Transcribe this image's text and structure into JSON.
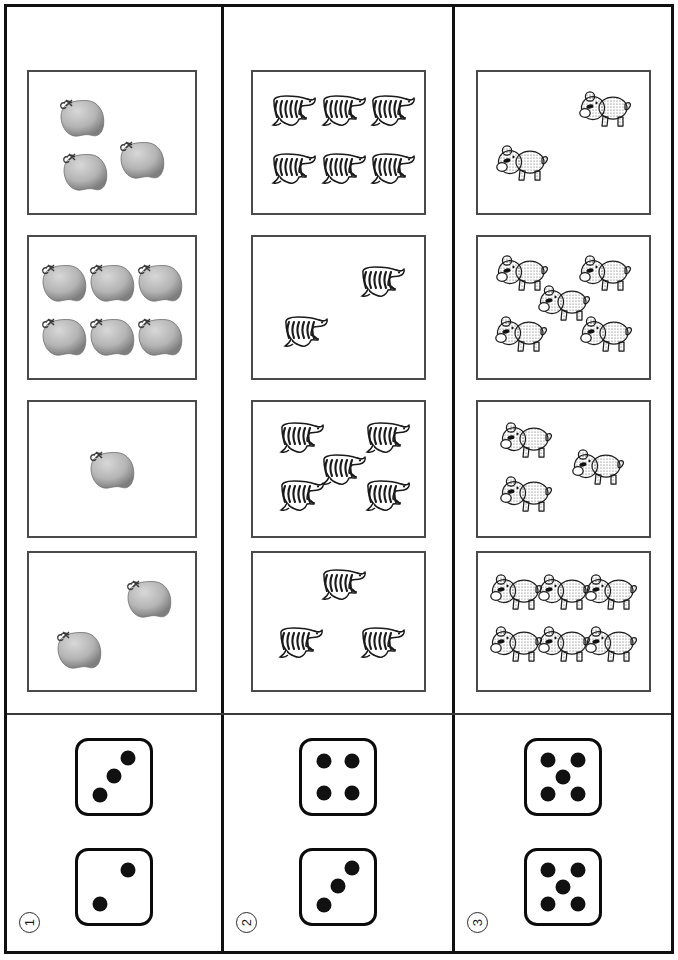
{
  "worksheet": {
    "layout": "three-column counting worksheet",
    "rows": 4,
    "columns": 3
  },
  "colors": {
    "ink": "#111111",
    "box_border": "#4a4a4a",
    "apple_light": "#d8d8d8",
    "apple_dark": "#7e7e7e",
    "zebra_stripe": "#1a1a1a",
    "bear_fill": "#f2f2f2",
    "bear_speckle": "#5a5a5a"
  },
  "columns": [
    {
      "id": "column-1",
      "number_label": "1",
      "icon_name": "apple-icon",
      "boxes": [
        {
          "row": 1,
          "count": 3,
          "arrangement": "scatter-3"
        },
        {
          "row": 2,
          "count": 6,
          "arrangement": "grid-3x2"
        },
        {
          "row": 3,
          "count": 1,
          "arrangement": "center-1"
        },
        {
          "row": 4,
          "count": 2,
          "arrangement": "diagonal-2"
        }
      ],
      "dice": [
        {
          "position": "top",
          "value": 3,
          "face_name": "die-face-3"
        },
        {
          "position": "bottom",
          "value": 2,
          "face_name": "die-face-2"
        }
      ]
    },
    {
      "id": "column-2",
      "number_label": "2",
      "icon_name": "zebra-icon",
      "boxes": [
        {
          "row": 1,
          "count": 6,
          "arrangement": "grid-3x2"
        },
        {
          "row": 2,
          "count": 2,
          "arrangement": "diagonal-2"
        },
        {
          "row": 3,
          "count": 5,
          "arrangement": "quincunx-5"
        },
        {
          "row": 4,
          "count": 3,
          "arrangement": "triangle-3"
        }
      ],
      "dice": [
        {
          "position": "top",
          "value": 4,
          "face_name": "die-face-4"
        },
        {
          "position": "bottom",
          "value": 3,
          "face_name": "die-face-3"
        }
      ]
    },
    {
      "id": "column-3",
      "number_label": "3",
      "icon_name": "bear-icon",
      "boxes": [
        {
          "row": 1,
          "count": 2,
          "arrangement": "diagonal-2"
        },
        {
          "row": 2,
          "count": 5,
          "arrangement": "quincunx-5"
        },
        {
          "row": 3,
          "count": 3,
          "arrangement": "scatter-3"
        },
        {
          "row": 4,
          "count": 6,
          "arrangement": "grid-3x2"
        }
      ],
      "dice": [
        {
          "position": "top",
          "value": 5,
          "face_name": "die-face-5"
        },
        {
          "position": "bottom",
          "value": 5,
          "face_name": "die-face-5"
        }
      ]
    }
  ],
  "item_positions": {
    "c1r1": [
      [
        32,
        32
      ],
      [
        68,
        62
      ],
      [
        34,
        70
      ]
    ],
    "c1r2": [
      [
        21,
        32
      ],
      [
        50,
        32
      ],
      [
        79,
        32
      ],
      [
        21,
        70
      ],
      [
        50,
        70
      ],
      [
        79,
        70
      ]
    ],
    "c1r3": [
      [
        50,
        50
      ]
    ],
    "c1r4": [
      [
        72,
        33
      ],
      [
        30,
        70
      ]
    ],
    "c2r1": [
      [
        21,
        29
      ],
      [
        50,
        29
      ],
      [
        79,
        29
      ],
      [
        21,
        70
      ],
      [
        50,
        70
      ],
      [
        79,
        70
      ]
    ],
    "c2r2": [
      [
        73,
        33
      ],
      [
        28,
        69
      ]
    ],
    "c2r3": [
      [
        26,
        28
      ],
      [
        76,
        28
      ],
      [
        50,
        52
      ],
      [
        26,
        72
      ],
      [
        76,
        72
      ]
    ],
    "c2r4": [
      [
        50,
        25
      ],
      [
        25,
        67
      ],
      [
        73,
        67
      ]
    ],
    "c3r1": [
      [
        74,
        28
      ],
      [
        26,
        66
      ]
    ],
    "c3r2": [
      [
        26,
        27
      ],
      [
        74,
        27
      ],
      [
        50,
        48
      ],
      [
        25,
        70
      ],
      [
        75,
        70
      ]
    ],
    "c3r3": [
      [
        28,
        30
      ],
      [
        70,
        50
      ],
      [
        28,
        70
      ]
    ],
    "c3r4": [
      [
        22,
        30
      ],
      [
        50,
        30
      ],
      [
        78,
        30
      ],
      [
        22,
        68
      ],
      [
        50,
        68
      ],
      [
        78,
        68
      ]
    ]
  },
  "die_pip_layouts": {
    "2": [
      [
        70,
        26
      ],
      [
        30,
        74
      ]
    ],
    "3": [
      [
        70,
        24
      ],
      [
        50,
        49
      ],
      [
        30,
        75
      ]
    ],
    "4": [
      [
        30,
        28
      ],
      [
        70,
        28
      ],
      [
        30,
        72
      ],
      [
        70,
        72
      ]
    ],
    "5": [
      [
        29,
        27
      ],
      [
        71,
        27
      ],
      [
        50,
        50
      ],
      [
        29,
        73
      ],
      [
        71,
        73
      ]
    ]
  }
}
